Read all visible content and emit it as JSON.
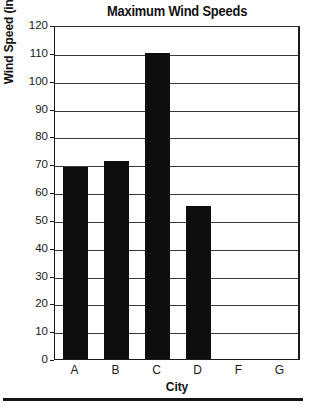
{
  "chart_data": {
    "type": "bar",
    "title": "Maximum Wind Speeds",
    "xlabel": "City",
    "ylabel": "Wind Speed (in MPH)",
    "categories": [
      "A",
      "B",
      "C",
      "D",
      "F",
      "G"
    ],
    "values": [
      69,
      71,
      110,
      55,
      null,
      null
    ],
    "ylim": [
      0,
      120
    ],
    "ytick_step": 10,
    "yticks": [
      120,
      110,
      100,
      90,
      80,
      70,
      60,
      50,
      40,
      30,
      20,
      10,
      0
    ],
    "grid": true,
    "legend": "none",
    "bar_color": "#0d0d0d",
    "background_color": "#ffffff",
    "axis_color": "#1a1a1a"
  },
  "figure": {
    "title": "Maximum Wind Speeds",
    "y_axis_title": "Wind Speed (in MPH)",
    "x_axis_title": "City"
  }
}
